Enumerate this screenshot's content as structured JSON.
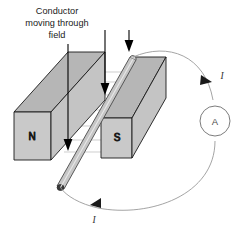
{
  "figure": {
    "background_color": "#ffffff"
  },
  "caption": {
    "line1": "Conductor",
    "line2": "moving through",
    "line3": "field"
  },
  "magnets": [
    {
      "id": "north-magnet",
      "pole_label": "N",
      "face_color": "#c9c9c9",
      "top_color": "#b6b6b6",
      "side_color": "#c9c9c9",
      "edge_color": "#1a1a1a"
    },
    {
      "id": "south-magnet",
      "pole_label": "S",
      "face_color": "#c9c9c9",
      "top_color": "#b6b6b6",
      "side_color": "#c9c9c9",
      "edge_color": "#1a1a1a"
    }
  ],
  "conductor": {
    "label": "conductor-rod",
    "fill_color": "#c6c6c6",
    "edge_color": "#4a4a4a"
  },
  "motion_arrows": [
    {
      "id": "motion-arrow-left",
      "direction": "down",
      "color": "#000000"
    },
    {
      "id": "motion-arrow-middle",
      "direction": "down",
      "color": "#000000"
    },
    {
      "id": "motion-arrow-right",
      "direction": "down",
      "color": "#000000"
    }
  ],
  "field_lines": {
    "direction": "north-to-south",
    "color": "#b9b9b9",
    "count": 6
  },
  "circuit": {
    "wire_color": "#9a9a9a",
    "ammeter": {
      "label": "A",
      "name": "ammeter",
      "circle_color": "#6d6d6d"
    },
    "current_labels": [
      {
        "id": "current-label-top",
        "text": "I"
      },
      {
        "id": "current-label-bottom",
        "text": "I"
      }
    ],
    "current_arrows": [
      {
        "id": "current-arrow-top",
        "color": "#1a1a1a"
      },
      {
        "id": "current-arrow-bottom",
        "color": "#1a1a1a"
      }
    ]
  }
}
